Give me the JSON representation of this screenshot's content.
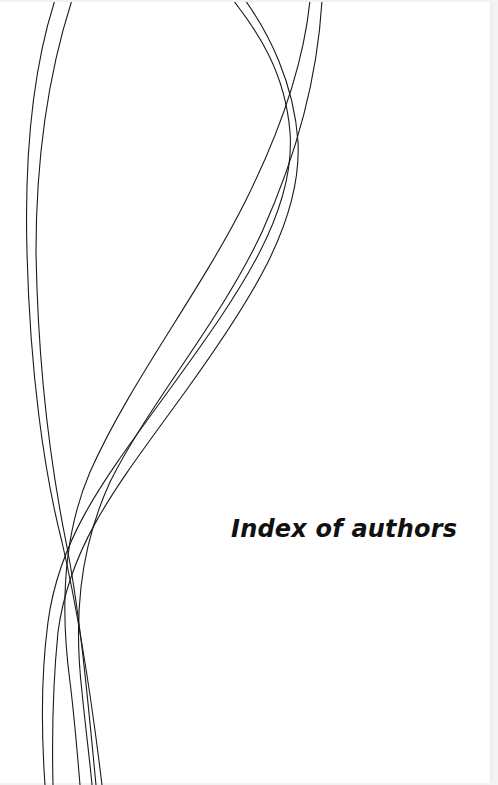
{
  "page": {
    "title": "Index of authors",
    "background_color": "#ffffff",
    "text_color": "#111111",
    "line_color": "#1a1a1a"
  },
  "decoration": {
    "type": "interwoven-curves",
    "curve_count": 6
  }
}
